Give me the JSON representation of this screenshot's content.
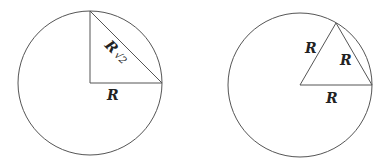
{
  "diagram": {
    "left": {
      "circle": {
        "cx": 90,
        "cy": 83,
        "r": 72
      },
      "labels": {
        "hypotenuse": "R",
        "hypotenuse_suffix": "√2",
        "base": "R"
      }
    },
    "right": {
      "circle": {
        "cx": 300,
        "cy": 85,
        "r": 72
      },
      "labels": {
        "left_side": "R",
        "right_side": "R",
        "base": "R"
      }
    },
    "stroke_color": "#555555"
  }
}
